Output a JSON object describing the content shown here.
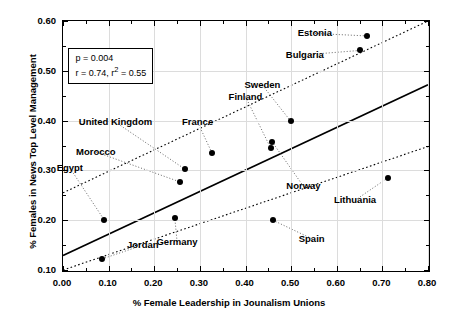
{
  "chart_data": {
    "type": "scatter",
    "title": "",
    "xlabel": "% Female Leadership in Jounalism Unions",
    "ylabel": "% Females in News Top Level Management",
    "xlim": [
      0.0,
      0.8
    ],
    "ylim": [
      0.1,
      0.6
    ],
    "xticks": [
      "0.00",
      "0.10",
      "0.20",
      "0.30",
      "0.40",
      "0.50",
      "0.60",
      "0.70",
      "0.80"
    ],
    "xtick_values": [
      0.0,
      0.1,
      0.2,
      0.3,
      0.4,
      0.5,
      0.6,
      0.7,
      0.8
    ],
    "yticks": [
      "0.10",
      "0.20",
      "0.30",
      "0.40",
      "0.50",
      "0.60"
    ],
    "ytick_values": [
      0.1,
      0.2,
      0.3,
      0.4,
      0.5,
      0.6
    ],
    "grid": true,
    "legend": false,
    "points": [
      {
        "label": "Jordan",
        "x": 0.085,
        "y": 0.122,
        "label_x": 0.175,
        "label_y": 0.15,
        "anchor": "start"
      },
      {
        "label": "Egypt",
        "x": 0.09,
        "y": 0.201,
        "label_x": 0.015,
        "label_y": 0.305,
        "anchor": "start"
      },
      {
        "label": "Germany",
        "x": 0.245,
        "y": 0.205,
        "label_x": 0.25,
        "label_y": 0.157,
        "anchor": "start"
      },
      {
        "label": "Morocco",
        "x": 0.256,
        "y": 0.277,
        "label_x": 0.072,
        "label_y": 0.337,
        "anchor": "start"
      },
      {
        "label": "United Kingdom",
        "x": 0.268,
        "y": 0.302,
        "label_x": 0.115,
        "label_y": 0.397,
        "anchor": "start"
      },
      {
        "label": "France",
        "x": 0.327,
        "y": 0.334,
        "label_x": 0.295,
        "label_y": 0.397,
        "anchor": "start"
      },
      {
        "label": "Finland",
        "x": 0.455,
        "y": 0.345,
        "label_x": 0.4,
        "label_y": 0.448,
        "anchor": "start"
      },
      {
        "label": "Norway",
        "x": 0.458,
        "y": 0.358,
        "label_x": 0.527,
        "label_y": 0.268,
        "anchor": "start"
      },
      {
        "label": "Spain",
        "x": 0.46,
        "y": 0.2,
        "label_x": 0.545,
        "label_y": 0.163,
        "anchor": "start"
      },
      {
        "label": "Sweden",
        "x": 0.499,
        "y": 0.399,
        "label_x": 0.437,
        "label_y": 0.471,
        "anchor": "start"
      },
      {
        "label": "Bulgaria",
        "x": 0.652,
        "y": 0.541,
        "label_x": 0.53,
        "label_y": 0.532,
        "anchor": "start"
      },
      {
        "label": "Estonia",
        "x": 0.667,
        "y": 0.57,
        "label_x": 0.552,
        "label_y": 0.575,
        "anchor": "start"
      },
      {
        "label": "Lithuania",
        "x": 0.712,
        "y": 0.285,
        "label_x": 0.64,
        "label_y": 0.24,
        "anchor": "start"
      }
    ],
    "fit_line": {
      "x0": 0.0,
      "y0": 0.129,
      "x1": 0.8,
      "y1": 0.472
    },
    "confidence_upper": {
      "x0": 0.0,
      "y0": 0.255,
      "x1": 0.8,
      "y1": 0.6
    },
    "confidence_lower": {
      "x0": 0.0,
      "y0": 0.1,
      "x1": 0.8,
      "y1": 0.348
    },
    "annotation": {
      "p_value": "p = 0.004",
      "r_value": "r = 0.74, r",
      "r2_sup": "2",
      "r2_value": " = 0.55"
    }
  }
}
